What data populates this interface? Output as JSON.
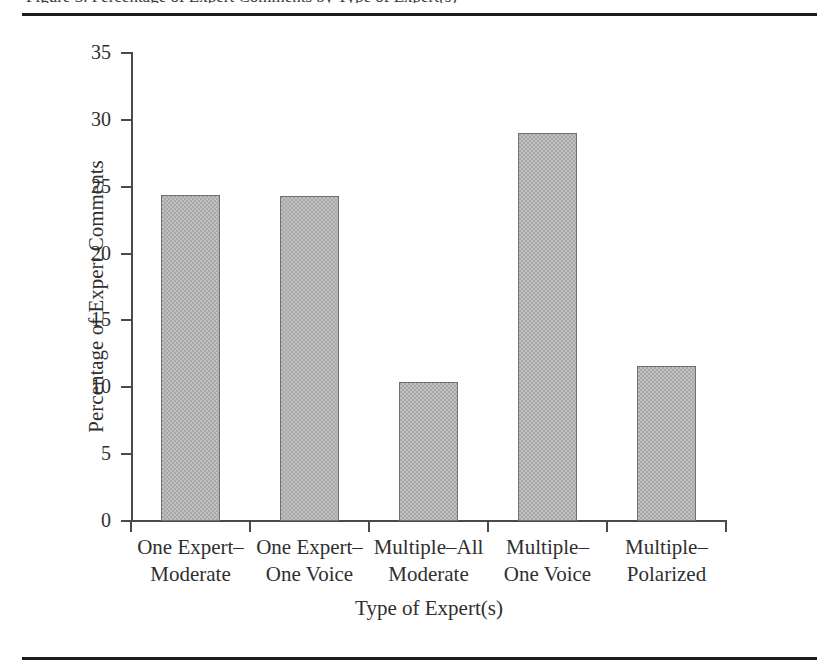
{
  "figure": {
    "caption_partial": "Figure 3. Percentage of Expert Comments by Type of Expert(s)",
    "top_rule": "horizontal-rule",
    "bottom_rule": "horizontal-rule"
  },
  "chart_data": {
    "type": "bar",
    "title": "",
    "xlabel": "Type of Expert(s)",
    "ylabel": "Percentage of Expert Comments",
    "categories": [
      "One Expert–\nModerate",
      "One Expert–\nOne Voice",
      "Multiple–All\nModerate",
      "Multiple–\nOne Voice",
      "Multiple–\nPolarized"
    ],
    "category_lines": [
      [
        "One Expert–",
        "Moderate"
      ],
      [
        "One Expert–",
        "One Voice"
      ],
      [
        "Multiple–All",
        "Moderate"
      ],
      [
        "Multiple–",
        "One Voice"
      ],
      [
        "Multiple–",
        "Polarized"
      ]
    ],
    "values": [
      24.4,
      24.3,
      10.4,
      29.0,
      11.6
    ],
    "ylim": [
      0,
      35
    ],
    "ytick_values": [
      0,
      5,
      10,
      15,
      20,
      25,
      30,
      35
    ],
    "ytick_labels": [
      "0",
      "5",
      "10",
      "15",
      "20",
      "25",
      "30",
      "35"
    ],
    "grid": false,
    "legend": false,
    "bar_color": "#a8a8a8",
    "bar_edge_color": "#6f6f6f",
    "axis_color": "#4a4a4a"
  }
}
